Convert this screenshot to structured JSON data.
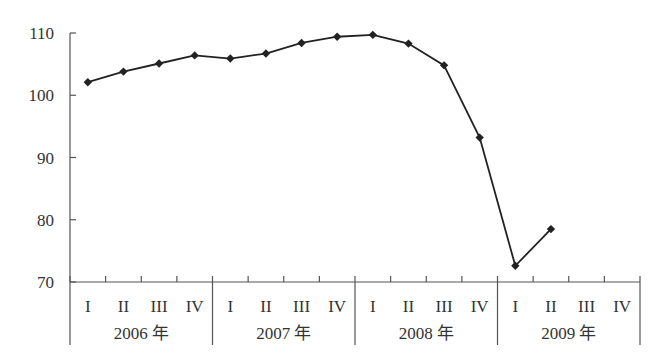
{
  "chart_data": {
    "type": "line",
    "title": "",
    "xlabel": "",
    "ylabel": "",
    "ylim": [
      70,
      110
    ],
    "yticks": [
      70,
      80,
      90,
      100,
      110
    ],
    "grid": false,
    "legend": null,
    "groups": [
      {
        "label": "2006 年",
        "quarters": [
          "I",
          "II",
          "III",
          "IV"
        ]
      },
      {
        "label": "2007 年",
        "quarters": [
          "I",
          "II",
          "III",
          "IV"
        ]
      },
      {
        "label": "2008 年",
        "quarters": [
          "I",
          "II",
          "III",
          "IV"
        ]
      },
      {
        "label": "2009 年",
        "quarters": [
          "I",
          "II",
          "III",
          "IV"
        ]
      }
    ],
    "categories": [
      "2006 I",
      "2006 II",
      "2006 III",
      "2006 IV",
      "2007 I",
      "2007 II",
      "2007 III",
      "2007 IV",
      "2008 I",
      "2008 II",
      "2008 III",
      "2008 IV",
      "2009 I",
      "2009 II",
      "2009 III",
      "2009 IV"
    ],
    "series": [
      {
        "name": "index",
        "marker": "diamond",
        "color": "#222222",
        "values": [
          102.1,
          103.8,
          105.1,
          106.4,
          105.9,
          106.7,
          108.4,
          109.4,
          109.7,
          108.3,
          104.8,
          93.2,
          72.6,
          78.5,
          null,
          null
        ]
      }
    ]
  }
}
